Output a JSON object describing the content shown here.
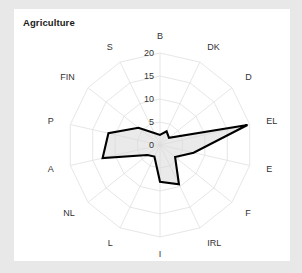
{
  "page": {
    "background": "#e8e8e8",
    "card_background": "#ffffff"
  },
  "chart_data": {
    "type": "radar",
    "title": "Agriculture",
    "xlabel": "",
    "ylabel": "",
    "grid": true,
    "legend_position": "none",
    "rlim": [
      0,
      20
    ],
    "rticks": [
      0,
      5,
      10,
      15,
      20
    ],
    "rtick_labels": [
      "0",
      "5",
      "10",
      "15",
      "20"
    ],
    "categories": [
      "B",
      "DK",
      "D",
      "EL",
      "E",
      "F",
      "IRL",
      "I",
      "L",
      "NL",
      "A",
      "P",
      "FIN",
      "S"
    ],
    "series": [
      {
        "name": "Agriculture",
        "line_color": "#000000",
        "fill_color": "#d9d9d9",
        "values": [
          2.2,
          3.3,
          2.5,
          19.5,
          7.5,
          4.2,
          9.5,
          8.0,
          2.8,
          3.5,
          12.8,
          11.5,
          6.0,
          2.9
        ]
      }
    ],
    "axis_colors": {
      "web": "#e0e0e0",
      "spoke": "#e0e0e0",
      "text": "#333333"
    }
  }
}
